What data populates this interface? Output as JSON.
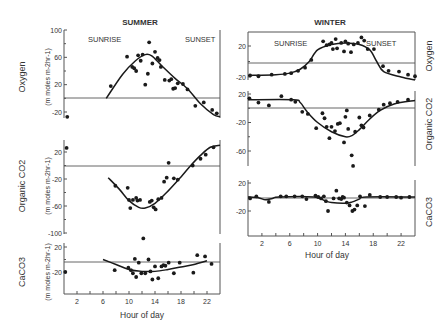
{
  "chart_data": [
    {
      "type": "scatter",
      "panel": "summer-oxygen",
      "season": "SUMMER",
      "title": "SUMMER",
      "ylabel": "Oxygen",
      "yunits": "(m moles m-2hr-1)",
      "ylim": [
        -30,
        100
      ],
      "yticks": [
        100,
        60,
        20,
        -20
      ],
      "xlim": [
        0,
        24
      ],
      "annotations": [
        "SUNRISE",
        "SUNSET"
      ],
      "fit_line": [
        [
          6.5,
          0
        ],
        [
          9,
          35
        ],
        [
          11,
          55
        ],
        [
          12.5,
          64
        ],
        [
          13.5,
          62
        ],
        [
          15,
          48
        ],
        [
          17,
          30
        ],
        [
          19,
          14
        ],
        [
          21,
          -8
        ],
        [
          23,
          -24
        ],
        [
          24,
          -27
        ]
      ],
      "points": [
        [
          0.5,
          -27
        ],
        [
          7.2,
          18
        ],
        [
          9.7,
          61
        ],
        [
          10.5,
          46
        ],
        [
          10.8,
          44
        ],
        [
          11.1,
          40
        ],
        [
          11.4,
          63
        ],
        [
          11.8,
          55
        ],
        [
          12.1,
          64
        ],
        [
          12.5,
          20
        ],
        [
          12.9,
          36
        ],
        [
          13.1,
          82
        ],
        [
          13.6,
          51
        ],
        [
          14.0,
          68
        ],
        [
          14.4,
          59
        ],
        [
          14.7,
          56
        ],
        [
          14.9,
          46
        ],
        [
          15.5,
          27
        ],
        [
          16.2,
          26
        ],
        [
          16.5,
          28
        ],
        [
          16.8,
          14
        ],
        [
          17.1,
          15
        ],
        [
          17.5,
          22
        ],
        [
          18.3,
          21
        ],
        [
          19.0,
          13
        ],
        [
          20.2,
          -11
        ],
        [
          21.5,
          -6
        ],
        [
          22.8,
          -17
        ],
        [
          23.5,
          -22
        ]
      ]
    },
    {
      "type": "scatter",
      "panel": "summer-organic-co2",
      "season": "SUMMER",
      "ylabel": "Organic CO2",
      "yunits": "(m moles m-2hr-1)",
      "ylim": [
        -100,
        30
      ],
      "yticks": [
        20,
        -20,
        -60,
        -100
      ],
      "xlim": [
        0,
        24
      ],
      "fit_line": [
        [
          6.8,
          -18
        ],
        [
          8.5,
          -35
        ],
        [
          10,
          -52
        ],
        [
          11.5,
          -62
        ],
        [
          12.5,
          -63
        ],
        [
          14,
          -56
        ],
        [
          16,
          -38
        ],
        [
          18,
          -17
        ],
        [
          19.5,
          0
        ],
        [
          21,
          15
        ],
        [
          22.5,
          27
        ],
        [
          24,
          30
        ]
      ],
      "points": [
        [
          0.4,
          26
        ],
        [
          7.9,
          -30
        ],
        [
          9.8,
          -33
        ],
        [
          10.0,
          -51
        ],
        [
          10.2,
          -63
        ],
        [
          10.6,
          -51
        ],
        [
          11.1,
          -48
        ],
        [
          11.3,
          -52
        ],
        [
          11.7,
          -51
        ],
        [
          12.2,
          -108
        ],
        [
          13.2,
          -54
        ],
        [
          13.5,
          -52
        ],
        [
          13.8,
          -62
        ],
        [
          14.1,
          -65
        ],
        [
          14.5,
          -50
        ],
        [
          15.0,
          -48
        ],
        [
          15.4,
          -24
        ],
        [
          15.8,
          -18
        ],
        [
          16.1,
          4
        ],
        [
          16.9,
          -19
        ],
        [
          17.5,
          -21
        ],
        [
          19.8,
          0
        ],
        [
          21.0,
          10
        ],
        [
          21.8,
          16
        ],
        [
          23.0,
          27
        ]
      ]
    },
    {
      "type": "scatter",
      "panel": "summer-caco3",
      "season": "SUMMER",
      "ylabel": "CaCO3",
      "yunits": "(m moles m-2hr-1)",
      "ylim": [
        -40,
        25
      ],
      "yticks": [
        20,
        -20
      ],
      "xlim": [
        0,
        24
      ],
      "xlabel": "Hour of day",
      "xticks": [
        2,
        6,
        10,
        14,
        18,
        22
      ],
      "fit_line": [
        [
          6,
          0
        ],
        [
          8,
          -8
        ],
        [
          10,
          -16
        ],
        [
          12,
          -19
        ],
        [
          14,
          -19
        ],
        [
          16,
          -16
        ],
        [
          18,
          -12
        ],
        [
          20,
          -8
        ],
        [
          22,
          -2
        ]
      ],
      "points": [
        [
          0.2,
          -20
        ],
        [
          7.8,
          -17
        ],
        [
          9.9,
          -13
        ],
        [
          10.3,
          -17
        ],
        [
          10.6,
          -22
        ],
        [
          10.9,
          1
        ],
        [
          11.1,
          -28
        ],
        [
          11.5,
          -5
        ],
        [
          11.9,
          -22
        ],
        [
          12.5,
          -22
        ],
        [
          13.0,
          0
        ],
        [
          13.3,
          -19
        ],
        [
          13.6,
          -32
        ],
        [
          14.0,
          -11
        ],
        [
          14.5,
          -30
        ],
        [
          15.0,
          -11
        ],
        [
          15.3,
          -9
        ],
        [
          15.6,
          -10
        ],
        [
          16.1,
          -5
        ],
        [
          16.9,
          -22
        ],
        [
          17.8,
          -5
        ],
        [
          19.9,
          -21
        ],
        [
          20.5,
          7
        ],
        [
          21.7,
          5
        ],
        [
          22.7,
          -7
        ]
      ]
    },
    {
      "type": "scatter",
      "panel": "winter-oxygen",
      "season": "WINTER",
      "title": "WINTER",
      "ylabel": "Oxygen",
      "ylim": [
        -25,
        35
      ],
      "yticks": [
        20,
        -20
      ],
      "xlim": [
        0,
        24
      ],
      "annotations": [
        "SUNRISE",
        "SUNSET"
      ],
      "fit_line": [
        [
          0,
          -18
        ],
        [
          4,
          -17
        ],
        [
          6,
          -15
        ],
        [
          7.5,
          -10
        ],
        [
          8.8,
          0
        ],
        [
          10,
          15
        ],
        [
          12,
          22
        ],
        [
          14,
          24
        ],
        [
          16,
          22
        ],
        [
          17.5,
          15
        ],
        [
          18.5,
          0
        ],
        [
          19.5,
          -13
        ],
        [
          22,
          -20
        ],
        [
          24,
          -24
        ]
      ],
      "points": [
        [
          0.3,
          -18
        ],
        [
          1.5,
          -19
        ],
        [
          3.4,
          -17
        ],
        [
          5.3,
          -16
        ],
        [
          6.2,
          -15
        ],
        [
          7.2,
          -12
        ],
        [
          8.2,
          -8
        ],
        [
          9.1,
          2
        ],
        [
          10.8,
          26
        ],
        [
          11.3,
          21
        ],
        [
          11.7,
          22
        ],
        [
          12.0,
          24
        ],
        [
          12.2,
          16
        ],
        [
          12.6,
          29
        ],
        [
          12.8,
          17
        ],
        [
          13.4,
          24
        ],
        [
          13.8,
          13
        ],
        [
          14.0,
          26
        ],
        [
          14.4,
          23
        ],
        [
          14.8,
          12
        ],
        [
          15.2,
          22
        ],
        [
          15.8,
          24
        ],
        [
          16.3,
          31
        ],
        [
          16.7,
          27
        ],
        [
          17.2,
          16
        ],
        [
          18.1,
          16
        ],
        [
          19.4,
          -6
        ],
        [
          20.2,
          -12
        ],
        [
          21.7,
          -13
        ],
        [
          23.0,
          -17
        ],
        [
          24.0,
          -19
        ]
      ]
    },
    {
      "type": "scatter",
      "panel": "winter-organic-co2",
      "season": "WINTER",
      "ylabel": "Organic CO2",
      "ylim": [
        -80,
        25
      ],
      "yticks": [
        20,
        -20,
        -60
      ],
      "xlim": [
        0,
        24
      ],
      "fit_line": [
        [
          0,
          12
        ],
        [
          6.5,
          12
        ],
        [
          7.5,
          8
        ],
        [
          8.5,
          -5
        ],
        [
          10,
          -20
        ],
        [
          12,
          -33
        ],
        [
          14,
          -40
        ],
        [
          15,
          -38
        ],
        [
          16,
          -30
        ],
        [
          17.5,
          -15
        ],
        [
          19,
          -3
        ],
        [
          21,
          6
        ],
        [
          24,
          11
        ]
      ],
      "points": [
        [
          0.2,
          14
        ],
        [
          1.5,
          8
        ],
        [
          3.0,
          4
        ],
        [
          4.8,
          17
        ],
        [
          6.2,
          12
        ],
        [
          6.8,
          9
        ],
        [
          7.8,
          -5
        ],
        [
          8.6,
          -8
        ],
        [
          9.8,
          -28
        ],
        [
          10.7,
          -7
        ],
        [
          11.0,
          -14
        ],
        [
          11.3,
          -26
        ],
        [
          11.7,
          -42
        ],
        [
          12.0,
          -26
        ],
        [
          12.5,
          -32
        ],
        [
          12.9,
          -22
        ],
        [
          13.2,
          -21
        ],
        [
          13.8,
          -48
        ],
        [
          14.0,
          -12
        ],
        [
          14.2,
          -3
        ],
        [
          14.4,
          -29
        ],
        [
          14.9,
          -66
        ],
        [
          15.1,
          -81
        ],
        [
          15.4,
          -33
        ],
        [
          16.0,
          -13
        ],
        [
          16.3,
          -24
        ],
        [
          16.6,
          -27
        ],
        [
          17.5,
          -10
        ],
        [
          18.8,
          -2
        ],
        [
          19.5,
          5
        ],
        [
          20.4,
          7
        ],
        [
          21.5,
          9
        ],
        [
          23.0,
          12
        ]
      ]
    },
    {
      "type": "scatter",
      "panel": "winter-caco3",
      "season": "WINTER",
      "ylabel": "CaCO3",
      "ylim": [
        -40,
        22
      ],
      "yticks": [
        20,
        -20
      ],
      "xlim": [
        0,
        24
      ],
      "xlabel": "Hour of day",
      "xticks": [
        2,
        6,
        10,
        14,
        18,
        22
      ],
      "fit_line": [
        [
          0,
          0
        ],
        [
          1.5,
          -1
        ],
        [
          2.5,
          -4
        ],
        [
          3.5,
          -2
        ],
        [
          4.5,
          0
        ],
        [
          9.5,
          0
        ],
        [
          11,
          -5
        ],
        [
          12,
          -8
        ],
        [
          14,
          -9
        ],
        [
          15,
          -7
        ],
        [
          16,
          -3
        ],
        [
          17,
          0
        ],
        [
          24,
          0
        ]
      ],
      "points": [
        [
          0.3,
          -2
        ],
        [
          1.2,
          1
        ],
        [
          3.0,
          -7
        ],
        [
          4.7,
          1
        ],
        [
          5.5,
          1
        ],
        [
          6.7,
          1
        ],
        [
          7.8,
          1
        ],
        [
          8.4,
          -3
        ],
        [
          9.7,
          2
        ],
        [
          10.1,
          0
        ],
        [
          10.5,
          -2
        ],
        [
          10.9,
          1
        ],
        [
          11.5,
          -20
        ],
        [
          11.2,
          -6
        ],
        [
          12.3,
          -2
        ],
        [
          12.7,
          9
        ],
        [
          13.1,
          -2
        ],
        [
          13.4,
          -3
        ],
        [
          13.6,
          0
        ],
        [
          13.8,
          -1
        ],
        [
          14.2,
          -8
        ],
        [
          14.6,
          -12
        ],
        [
          15.0,
          -20
        ],
        [
          15.3,
          -18
        ],
        [
          15.7,
          -12
        ],
        [
          16.1,
          1
        ],
        [
          16.8,
          -13
        ],
        [
          17.5,
          3
        ],
        [
          19.0,
          0
        ],
        [
          20.0,
          0
        ],
        [
          21.3,
          0
        ],
        [
          22.0,
          -1
        ],
        [
          23.2,
          0
        ]
      ]
    }
  ],
  "labels": {
    "summer_title": "SUMMER",
    "winter_title": "WINTER",
    "sunrise": "SUNRISE",
    "sunset": "SUNSET",
    "oxygen": "Oxygen",
    "organic_co2": "Organic CO2",
    "caco3": "CaCO3",
    "units": "(m  moles m-2hr-1)",
    "xlabel": "Hour of day"
  },
  "colors": {
    "ink": "#1a1a1a",
    "axis": "#555555",
    "text": "#333333",
    "background": "#ffffff"
  }
}
